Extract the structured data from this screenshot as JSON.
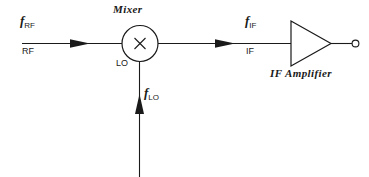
{
  "diagram": {
    "stroke_color": "#1a1a1a",
    "background_color": "#ffffff",
    "components": {
      "mixer": {
        "caption": "Mixer",
        "symbol": "×",
        "port_label": "LO"
      },
      "amplifier": {
        "caption": "IF Amplifier"
      }
    },
    "signals": {
      "rf": {
        "freq_symbol": "f",
        "freq_subscript": "RF",
        "port_label": "RF"
      },
      "lo": {
        "freq_symbol": "f",
        "freq_subscript": "LO",
        "port_label": "LO"
      },
      "if": {
        "freq_symbol": "f",
        "freq_subscript": "IF",
        "port_label": "IF"
      }
    }
  }
}
